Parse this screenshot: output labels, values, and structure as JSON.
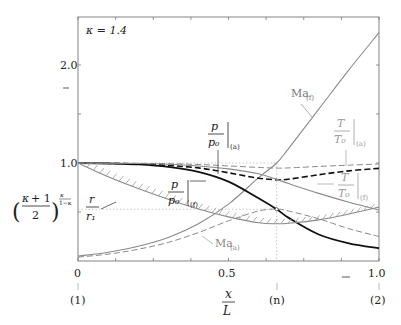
{
  "chart_data": {
    "type": "line",
    "title": "",
    "annotation_kappa": "κ = 1.4",
    "xlabel_num": "x",
    "xlabel_den": "L",
    "xlim": [
      0,
      1.0
    ],
    "ylim": [
      0,
      2.5
    ],
    "x_ticks": [
      {
        "value": 0,
        "label": "0"
      },
      {
        "value": 0.5,
        "label": "0.5"
      },
      {
        "value": 1.0,
        "label": "1.0"
      }
    ],
    "x_station_labels": [
      {
        "value": 0,
        "label": "(1)"
      },
      {
        "value": 0.66,
        "label": "(n)"
      },
      {
        "value": 1.0,
        "label": "(2)"
      }
    ],
    "y_ticks": [
      {
        "value": 1.0,
        "label": "1.0"
      },
      {
        "value": 2.0,
        "label": "2.0"
      }
    ],
    "critical_ratio": {
      "value": 0.528,
      "label_base": "(κ+1)/2",
      "label_exp": "κ/(1−κ)"
    },
    "throat_x": 0.66,
    "grid": false,
    "series": [
      {
        "name": "Ma_(f)",
        "label": "Ma",
        "sub": "(f)",
        "style": "solid-gray",
        "x": [
          0,
          0.1,
          0.2,
          0.3,
          0.4,
          0.5,
          0.6,
          0.66,
          0.7,
          0.8,
          0.9,
          1.0
        ],
        "values": [
          0.05,
          0.09,
          0.15,
          0.24,
          0.38,
          0.58,
          0.85,
          1.0,
          1.15,
          1.55,
          1.95,
          2.33
        ]
      },
      {
        "name": "Ma_(a)",
        "label": "Ma",
        "sub": "(a)",
        "style": "dashed-gray",
        "x": [
          0,
          0.1,
          0.2,
          0.3,
          0.4,
          0.5,
          0.6,
          0.66,
          0.7,
          0.8,
          0.9,
          1.0
        ],
        "values": [
          0.04,
          0.07,
          0.12,
          0.19,
          0.29,
          0.41,
          0.51,
          0.53,
          0.51,
          0.43,
          0.33,
          0.25
        ]
      },
      {
        "name": "p/p0_(f)",
        "label": "p/p0",
        "sub": "(f)",
        "style": "solid-black-thick",
        "x": [
          0,
          0.1,
          0.2,
          0.3,
          0.4,
          0.5,
          0.6,
          0.66,
          0.7,
          0.8,
          0.9,
          1.0
        ],
        "values": [
          1.0,
          0.995,
          0.985,
          0.96,
          0.91,
          0.81,
          0.64,
          0.528,
          0.44,
          0.27,
          0.18,
          0.13
        ]
      },
      {
        "name": "p/p0_(a)",
        "label": "p/p0",
        "sub": "(a)",
        "style": "dashed-black-thick",
        "x": [
          0,
          0.1,
          0.2,
          0.3,
          0.4,
          0.5,
          0.6,
          0.66,
          0.7,
          0.8,
          0.9,
          1.0
        ],
        "values": [
          1.0,
          0.997,
          0.99,
          0.975,
          0.95,
          0.9,
          0.845,
          0.83,
          0.835,
          0.88,
          0.92,
          0.945
        ]
      },
      {
        "name": "T/T0_(f)",
        "label": "T/T0",
        "sub": "(f)",
        "style": "solid-gray",
        "x": [
          0,
          0.1,
          0.2,
          0.3,
          0.4,
          0.5,
          0.6,
          0.66,
          0.7,
          0.8,
          0.9,
          1.0
        ],
        "values": [
          1.0,
          0.998,
          0.995,
          0.988,
          0.97,
          0.94,
          0.89,
          0.833,
          0.79,
          0.69,
          0.6,
          0.52
        ]
      },
      {
        "name": "T/T0_(a)",
        "label": "T/T0",
        "sub": "(a)",
        "style": "dashed-gray",
        "x": [
          0,
          0.1,
          0.2,
          0.3,
          0.4,
          0.5,
          0.6,
          0.66,
          0.7,
          0.8,
          0.9,
          1.0
        ],
        "values": [
          1.0,
          0.999,
          0.997,
          0.993,
          0.985,
          0.97,
          0.955,
          0.948,
          0.95,
          0.965,
          0.978,
          0.99
        ]
      },
      {
        "name": "r/r1",
        "label": "r/r1",
        "sub": "",
        "style": "hatched-gray",
        "x": [
          0,
          0.1,
          0.2,
          0.3,
          0.4,
          0.5,
          0.6,
          0.66,
          0.7,
          0.8,
          0.9,
          1.0
        ],
        "values": [
          1.0,
          0.86,
          0.74,
          0.63,
          0.53,
          0.45,
          0.39,
          0.38,
          0.385,
          0.42,
          0.48,
          0.55
        ]
      }
    ]
  }
}
